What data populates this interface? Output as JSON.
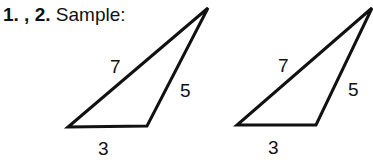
{
  "heading": {
    "numbers": "1. , 2.",
    "label": "Sample:"
  },
  "figures": [
    {
      "name": "triangle-1",
      "vertices": [
        [
          68,
          127
        ],
        [
          147,
          126
        ],
        [
          208,
          8
        ]
      ],
      "sides": {
        "top": "7",
        "right": "5",
        "bottom": "3"
      }
    },
    {
      "name": "triangle-2",
      "vertices": [
        [
          237,
          125
        ],
        [
          316,
          125
        ],
        [
          372,
          8
        ]
      ],
      "sides": {
        "top": "7",
        "right": "5",
        "bottom": "3"
      }
    }
  ]
}
